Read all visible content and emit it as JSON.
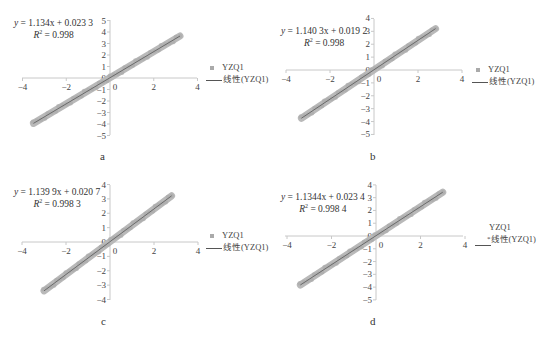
{
  "chart_data": [
    {
      "id": "a",
      "type": "scatter",
      "title": "",
      "sublabel": "a",
      "equation": {
        "prefix": "y",
        "text": " = 1.134x + 0.023 3"
      },
      "r2": {
        "label": "R",
        "value": " = 0.998"
      },
      "legend": {
        "series": "YZQ1",
        "trend": "线性(YZQ1)",
        "position": "right"
      },
      "xlim": [
        -4,
        4
      ],
      "ylim": [
        -5,
        5
      ],
      "xticks": [
        -4,
        -2,
        0,
        2,
        4
      ],
      "yticks": [
        5,
        4,
        3,
        2,
        1,
        0,
        -1,
        -2,
        -3,
        -4,
        -5
      ],
      "series": [
        {
          "name": "YZQ1",
          "x_range": [
            -3.5,
            3.2
          ],
          "slope": 1.134,
          "intercept": 0.0233
        }
      ],
      "trendline": {
        "name": "线性(YZQ1)",
        "slope": 1.134,
        "intercept": 0.0233,
        "r2": 0.998
      },
      "grid": false
    },
    {
      "id": "b",
      "type": "scatter",
      "title": "",
      "sublabel": "b",
      "equation": {
        "prefix": "y",
        "text": " = 1.140 3x + 0.019 2"
      },
      "r2": {
        "label": "R",
        "value": " = 0.998"
      },
      "legend": {
        "series": "YZQ1",
        "trend": "线性(YZQ1)",
        "position": "right"
      },
      "xlim": [
        -4,
        4
      ],
      "ylim": [
        -5,
        4
      ],
      "xticks": [
        -4,
        -2,
        0,
        2,
        4
      ],
      "yticks": [
        4,
        3,
        2,
        1,
        0,
        -1,
        -2,
        -3,
        -4,
        -5
      ],
      "series": [
        {
          "name": "YZQ1",
          "x_range": [
            -3.3,
            2.8
          ],
          "slope": 1.1403,
          "intercept": 0.0192
        }
      ],
      "trendline": {
        "name": "线性(YZQ1)",
        "slope": 1.1403,
        "intercept": 0.0192,
        "r2": 0.998
      },
      "grid": false
    },
    {
      "id": "c",
      "type": "scatter",
      "title": "",
      "sublabel": "c",
      "equation": {
        "prefix": "y",
        "text": " = 1.139 9x + 0.020 7"
      },
      "r2": {
        "label": "R",
        "value": " = 0.998 3"
      },
      "legend": {
        "series": "YZQ1",
        "trend": "线性(YZQ1)",
        "position": "right"
      },
      "xlim": [
        -4,
        4
      ],
      "ylim": [
        -4,
        4
      ],
      "xticks": [
        -4,
        -2,
        0,
        2,
        4
      ],
      "yticks": [
        4,
        3,
        2,
        1,
        0,
        -1,
        -2,
        -3,
        -4
      ],
      "series": [
        {
          "name": "YZQ1",
          "x_range": [
            -3.0,
            2.8
          ],
          "slope": 1.1399,
          "intercept": 0.0207
        }
      ],
      "trendline": {
        "name": "线性(YZQ1)",
        "slope": 1.1399,
        "intercept": 0.0207,
        "r2": 0.9983
      },
      "grid": false
    },
    {
      "id": "d",
      "type": "scatter",
      "title": "",
      "sublabel": "d",
      "equation": {
        "prefix": "y",
        "text": " = 1.1344x + 0.023 4"
      },
      "r2": {
        "label": "R",
        "value": " = 0.998 4"
      },
      "legend": {
        "series": "YZQ1",
        "trend": "线性(YZQ1)",
        "position": "right"
      },
      "xlim": [
        -4,
        4
      ],
      "ylim": [
        -5,
        4
      ],
      "xticks": [
        -4,
        -2,
        0,
        2,
        4
      ],
      "yticks": [
        4,
        3,
        2,
        1,
        0,
        -1,
        -2,
        -3,
        -4,
        -5
      ],
      "series": [
        {
          "name": "YZQ1",
          "x_range": [
            -3.4,
            3.0
          ],
          "slope": 1.1344,
          "intercept": 0.0234
        }
      ],
      "trendline": {
        "name": "线性(YZQ1)",
        "slope": 1.1344,
        "intercept": 0.0234,
        "r2": 0.9984
      },
      "grid": false
    }
  ],
  "colors": {
    "axis": "#c8c8c8",
    "scatter_band": "#b9b9b9",
    "trendline": "#6a6a6a",
    "text": "#333333"
  }
}
